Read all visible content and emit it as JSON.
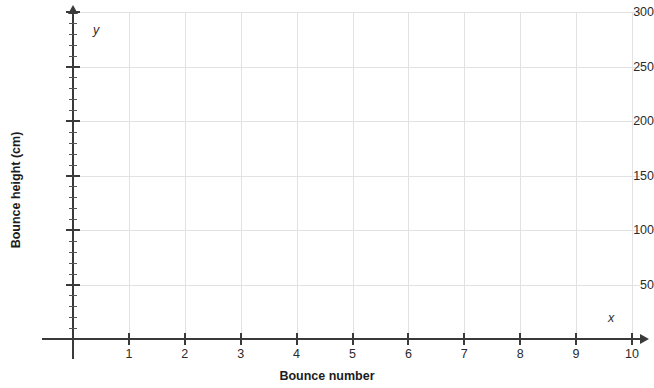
{
  "chart_data": {
    "type": "scatter",
    "title": "",
    "xlabel": "Bounce number",
    "ylabel": "Bounce height (cm)",
    "x_axis_name": "x",
    "y_axis_name": "y",
    "xlim": [
      0,
      10
    ],
    "ylim": [
      0,
      300
    ],
    "x_ticks": [
      1,
      2,
      3,
      4,
      5,
      6,
      7,
      8,
      9,
      10
    ],
    "x_tick_labels": [
      "1",
      "2",
      "3",
      "4",
      "5",
      "6",
      "7",
      "8",
      "9",
      "10"
    ],
    "y_ticks": [
      50,
      100,
      150,
      200,
      250,
      300
    ],
    "y_tick_labels": [
      "50",
      "100",
      "150",
      "200",
      "250",
      "300"
    ],
    "y_minor_tick_step": 10,
    "x_major_step": 1,
    "y_major_step": 50,
    "grid": true,
    "grid_color": "#e2e2e4",
    "axis_color": "#3a3a3a",
    "legend": false,
    "series": [],
    "values": [],
    "data_points_plotted": 0,
    "note": "Empty grid — no data series plotted"
  },
  "colors": {
    "background": "#ffffff",
    "grid": "#e2e2e4",
    "axis": "#3a3a3a",
    "text": "#1c1c1c"
  }
}
